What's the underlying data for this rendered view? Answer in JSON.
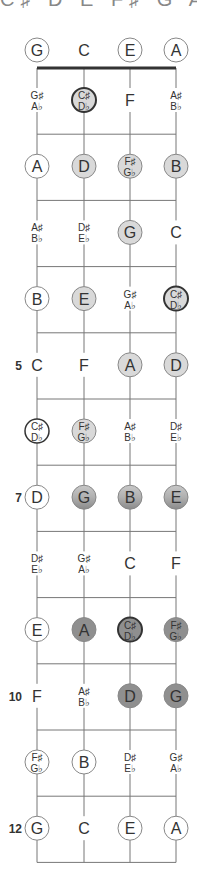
{
  "title": "C♯ D E F♯ G A B",
  "strings": [
    "G",
    "C",
    "E",
    "A"
  ],
  "colors": {
    "line": "#777777",
    "nut": "#333333",
    "light": "#d9d9d9",
    "mid": "#b3b3b3",
    "dark": "#8f8f8f",
    "text": "#333333"
  },
  "fret_labels": [
    {
      "fret": 5,
      "label": "5"
    },
    {
      "fret": 7,
      "label": "7"
    },
    {
      "fret": 10,
      "label": "10"
    },
    {
      "fret": 12,
      "label": "12"
    }
  ],
  "rows": [
    [
      {
        "n": "G",
        "s": "outline"
      },
      {
        "n": "C",
        "s": "none"
      },
      {
        "n": "E",
        "s": "outline"
      },
      {
        "n": "A",
        "s": "outline"
      }
    ],
    [
      {
        "n": "G♯|A♭",
        "s": "none"
      },
      {
        "n": "C♯|D♭",
        "s": "light-root"
      },
      {
        "n": "F",
        "s": "none"
      },
      {
        "n": "A♯|B♭",
        "s": "none"
      }
    ],
    [
      {
        "n": "A",
        "s": "outline"
      },
      {
        "n": "D",
        "s": "light"
      },
      {
        "n": "F♯|G♭",
        "s": "light"
      },
      {
        "n": "B",
        "s": "light"
      }
    ],
    [
      {
        "n": "A♯|B♭",
        "s": "none"
      },
      {
        "n": "D♯|E♭",
        "s": "none"
      },
      {
        "n": "G",
        "s": "light"
      },
      {
        "n": "C",
        "s": "none"
      }
    ],
    [
      {
        "n": "B",
        "s": "outline"
      },
      {
        "n": "E",
        "s": "light"
      },
      {
        "n": "G♯|A♭",
        "s": "none"
      },
      {
        "n": "C♯|D♭",
        "s": "light-root"
      }
    ],
    [
      {
        "n": "C",
        "s": "none"
      },
      {
        "n": "F",
        "s": "none"
      },
      {
        "n": "A",
        "s": "light"
      },
      {
        "n": "D",
        "s": "light"
      }
    ],
    [
      {
        "n": "C♯|D♭",
        "s": "root-outline"
      },
      {
        "n": "F♯|G♭",
        "s": "light"
      },
      {
        "n": "A♯|B♭",
        "s": "none"
      },
      {
        "n": "D♯|E♭",
        "s": "none"
      }
    ],
    [
      {
        "n": "D",
        "s": "outline"
      },
      {
        "n": "G",
        "s": "mid"
      },
      {
        "n": "B",
        "s": "mid"
      },
      {
        "n": "E",
        "s": "mid"
      }
    ],
    [
      {
        "n": "D♯|E♭",
        "s": "none"
      },
      {
        "n": "G♯|A♭",
        "s": "none"
      },
      {
        "n": "C",
        "s": "none"
      },
      {
        "n": "F",
        "s": "none"
      }
    ],
    [
      {
        "n": "E",
        "s": "outline"
      },
      {
        "n": "A",
        "s": "dark"
      },
      {
        "n": "C♯|D♭",
        "s": "dark-root"
      },
      {
        "n": "F♯|G♭",
        "s": "dark"
      }
    ],
    [
      {
        "n": "F",
        "s": "none"
      },
      {
        "n": "A♯|B♭",
        "s": "none"
      },
      {
        "n": "D",
        "s": "dark"
      },
      {
        "n": "G",
        "s": "dark"
      }
    ],
    [
      {
        "n": "F♯|G♭",
        "s": "outline"
      },
      {
        "n": "B",
        "s": "outline"
      },
      {
        "n": "D♯|E♭",
        "s": "none"
      },
      {
        "n": "G♯|A♭",
        "s": "none"
      }
    ],
    [
      {
        "n": "G",
        "s": "outline"
      },
      {
        "n": "C",
        "s": "none"
      },
      {
        "n": "E",
        "s": "outline"
      },
      {
        "n": "A",
        "s": "outline"
      }
    ]
  ]
}
